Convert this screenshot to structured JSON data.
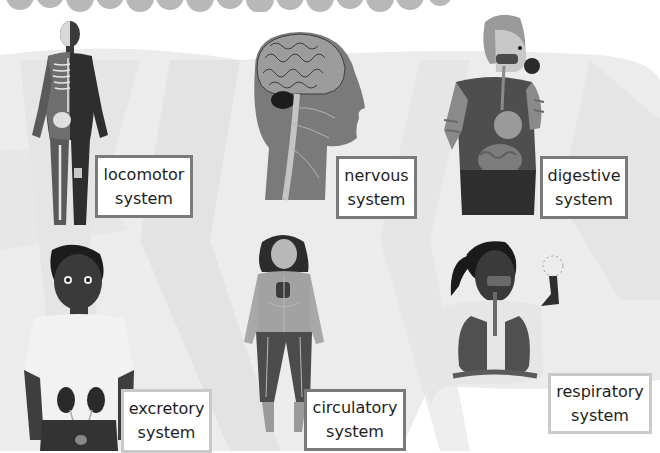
{
  "poster": {
    "colors": {
      "background": "#ffffff",
      "wash": "#ececec",
      "wash_dark": "#dcdcdc",
      "cloud": "#b8b8b8",
      "box_border": "#7a7a7a",
      "box_border_light": "#c9c9c9",
      "text": "#1e1e1e"
    },
    "systems": [
      {
        "id": "locomotor",
        "line1": "locomotor",
        "line2": "system",
        "figure": "skeleton-muscle-body-icon"
      },
      {
        "id": "nervous",
        "line1": "nervous",
        "line2": "system",
        "figure": "brain-head-icon"
      },
      {
        "id": "digestive",
        "line1": "digestive",
        "line2": "system",
        "figure": "boy-eating-apple-digestive-tract-icon"
      },
      {
        "id": "excretory",
        "line1": "excretory",
        "line2": "system",
        "figure": "boy-kidneys-icon"
      },
      {
        "id": "circulatory",
        "line1": "circulatory",
        "line2": "system",
        "figure": "girl-blood-vessels-icon"
      },
      {
        "id": "respiratory",
        "line1": "respiratory",
        "line2": "system",
        "figure": "girl-lungs-dandelion-icon"
      }
    ]
  }
}
